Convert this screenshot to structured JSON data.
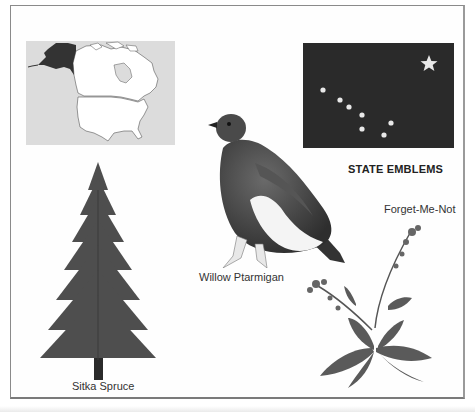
{
  "page": {
    "heading": "STATE EMBLEMS"
  },
  "emblems": {
    "map": {
      "label": "",
      "highlight_region": "Alaska"
    },
    "flag": {
      "label": "",
      "description": "Big Dipper and North Star on dark blue field"
    },
    "bird": {
      "label": "Willow Ptarmigan"
    },
    "tree": {
      "label": "Sitka Spruce"
    },
    "flower": {
      "label": "Forget-Me-Not"
    }
  },
  "colors": {
    "flag_field": "#2a2a2a",
    "star": "#e8e8e8",
    "map_background": "#dcdcdc",
    "alaska_fill": "#333333",
    "text": "#333333"
  }
}
